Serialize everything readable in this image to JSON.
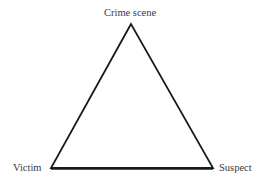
{
  "diagram": {
    "type": "triangle",
    "vertices": {
      "top": "Crime scene",
      "bottom_left": "Victim",
      "bottom_right": "Suspect"
    },
    "line_color": "#1a1a1a"
  }
}
